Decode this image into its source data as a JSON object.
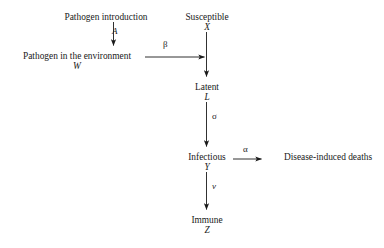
{
  "diagram": {
    "type": "flow-diagram",
    "background_color": "#ffffff",
    "ink_color": "#1a1a1a",
    "nodes": [
      {
        "id": "pathogen_introduction",
        "label": "Pathogen introduction",
        "symbol": "",
        "x": 106,
        "y": 12
      },
      {
        "id": "pathogen_environment",
        "label": "Pathogen in the environment",
        "symbol": "W",
        "x": 77,
        "y": 51
      },
      {
        "id": "susceptible",
        "label": "Susceptible",
        "symbol": "X",
        "x": 207,
        "y": 12
      },
      {
        "id": "latent",
        "label": "Latent",
        "symbol": "L",
        "x": 207,
        "y": 82
      },
      {
        "id": "infectious",
        "label": "Infectious",
        "symbol": "Y",
        "x": 207,
        "y": 152
      },
      {
        "id": "immune",
        "label": "Immune",
        "symbol": "Z",
        "x": 207,
        "y": 215
      },
      {
        "id": "disease_induced_deaths",
        "label": "Disease-induced deaths",
        "symbol": "",
        "x": 328,
        "y": 152
      }
    ],
    "edges": [
      {
        "id": "introduction-to-environment",
        "from": "pathogen_introduction",
        "to": "pathogen_environment",
        "rate_label": "A",
        "label_x": 112,
        "label_y": 27,
        "italic": true,
        "orientation": "vertical"
      },
      {
        "id": "environment-to-susceptible-transmission",
        "from": "pathogen_environment",
        "to": "susceptible",
        "rate_label": "β",
        "label_x": 163,
        "label_y": 40,
        "italic": false,
        "orientation": "horizontal"
      },
      {
        "id": "susceptible-to-latent",
        "from": "susceptible",
        "to": "latent",
        "rate_label": "",
        "label_x": 0,
        "label_y": 0,
        "italic": false,
        "orientation": "vertical"
      },
      {
        "id": "latent-to-infectious",
        "from": "latent",
        "to": "infectious",
        "rate_label": "σ",
        "label_x": 212,
        "label_y": 112,
        "italic": false,
        "orientation": "vertical"
      },
      {
        "id": "infectious-to-deaths",
        "from": "infectious",
        "to": "disease_induced_deaths",
        "rate_label": "α",
        "label_x": 243,
        "label_y": 145,
        "italic": false,
        "orientation": "horizontal"
      },
      {
        "id": "infectious-to-immune",
        "from": "infectious",
        "to": "immune",
        "rate_label": "ν",
        "label_x": 212,
        "label_y": 182,
        "italic": true,
        "orientation": "vertical"
      }
    ]
  }
}
